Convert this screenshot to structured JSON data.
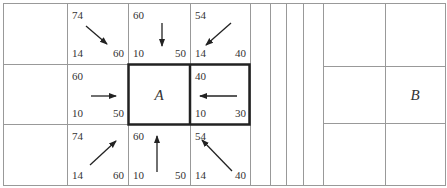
{
  "diagram": {
    "type": "astar-grid",
    "start_label": "A",
    "goal_label": "B",
    "cells": [
      {
        "id": "r0c1",
        "f": "74",
        "g": "14",
        "h": "60",
        "arrow": "down-right"
      },
      {
        "id": "r0c2",
        "f": "60",
        "g": "10",
        "h": "50",
        "arrow": "down"
      },
      {
        "id": "r0c3",
        "f": "54",
        "g": "14",
        "h": "40",
        "arrow": "down-left"
      },
      {
        "id": "r1c1",
        "f": "60",
        "g": "10",
        "h": "50",
        "arrow": "right"
      },
      {
        "id": "r1c3",
        "f": "40",
        "g": "10",
        "h": "30",
        "arrow": "left"
      },
      {
        "id": "r2c1",
        "f": "74",
        "g": "14",
        "h": "60",
        "arrow": "up-right"
      },
      {
        "id": "r2c2",
        "f": "60",
        "g": "10",
        "h": "50",
        "arrow": "up"
      },
      {
        "id": "r2c3",
        "f": "54",
        "g": "14",
        "h": "40",
        "arrow": "up-left"
      }
    ]
  }
}
